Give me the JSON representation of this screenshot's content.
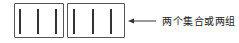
{
  "diagram": {
    "groups": [
      {
        "name": "group-1",
        "bars": 3
      },
      {
        "name": "group-2",
        "bars": 3
      }
    ],
    "arrow": {
      "direction": "left"
    },
    "label": "两个集合或两组",
    "colors": {
      "stroke": "#555555",
      "bar": "#333333",
      "text": "#222222"
    }
  }
}
